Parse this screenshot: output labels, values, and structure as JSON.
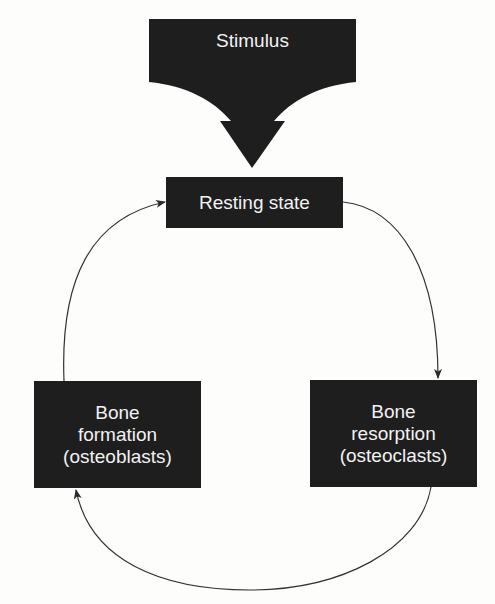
{
  "diagram": {
    "type": "cycle-flow",
    "stimulus": {
      "label": "Stimulus",
      "shape": "downward-arrow-banner"
    },
    "nodes": [
      {
        "id": "resting",
        "lines": [
          "Resting state"
        ]
      },
      {
        "id": "resorption",
        "lines": [
          "Bone",
          "resorption",
          "(osteoclasts)"
        ]
      },
      {
        "id": "formation",
        "lines": [
          "Bone",
          "formation",
          "(osteoblasts)"
        ]
      }
    ],
    "edges": [
      {
        "from": "stimulus",
        "to": "resting"
      },
      {
        "from": "resting",
        "to": "resorption"
      },
      {
        "from": "resorption",
        "to": "formation"
      },
      {
        "from": "formation",
        "to": "resting"
      }
    ],
    "colors": {
      "box_fill": "#1e1e1e",
      "box_text": "#f2f2f2",
      "line": "#333333",
      "background": "#fdfdfc"
    }
  }
}
